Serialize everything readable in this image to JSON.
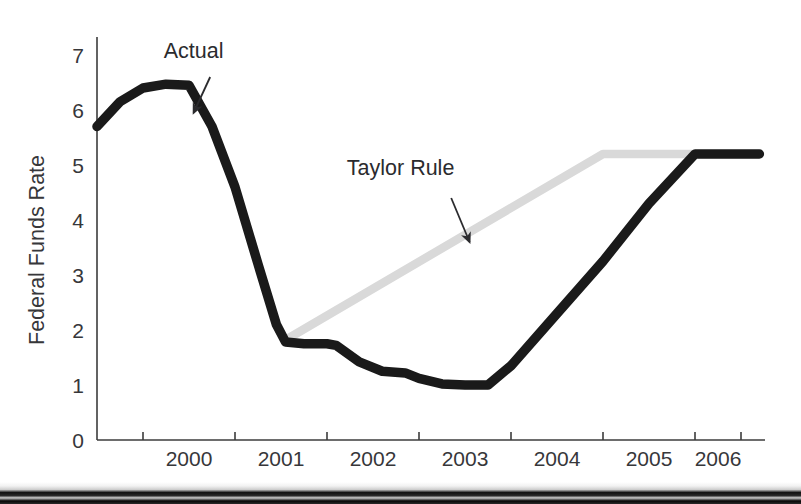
{
  "figure": {
    "background": "#ffffff",
    "scan_band": {
      "name": "scan-artifact-band",
      "top": 482,
      "height": 22,
      "colors": [
        "#f2f2f2",
        "#cfcfcf",
        "#111111",
        "#2a2a2a",
        "#050505"
      ]
    }
  },
  "chart_data": {
    "type": "line",
    "title": "",
    "subtitle": "",
    "xlabel": "",
    "ylabel": "Federal Funds Rate",
    "xlim": [
      1999.5,
      2006.75
    ],
    "ylim": [
      0,
      7.35
    ],
    "grid": false,
    "legend": "none (inline annotations with arrows)",
    "x_ticks": [
      2000.0,
      2001.0,
      2002.0,
      2003.0,
      2004.0,
      2005.0,
      2006.0,
      2006.5
    ],
    "x_tick_labels": [
      "2000",
      "2001",
      "2002",
      "2003",
      "2004",
      "2005",
      "2006"
    ],
    "x_tick_label_positions": [
      2000.5,
      2001.5,
      2002.5,
      2003.5,
      2004.5,
      2005.5,
      2006.25
    ],
    "y_ticks": [
      0,
      1,
      2,
      3,
      4,
      5,
      6,
      7
    ],
    "y_tick_labels": [
      "0",
      "1",
      "2",
      "3",
      "4",
      "5",
      "6",
      "7"
    ],
    "series": [
      {
        "name": "Actual",
        "color": "#1a1a1a",
        "linewidth": 9.5,
        "x": [
          1999.5,
          1999.75,
          2000.0,
          2000.25,
          2000.5,
          2000.75,
          2001.0,
          2001.25,
          2001.45,
          2001.55,
          2001.75,
          2002.0,
          2002.1,
          2002.35,
          2002.6,
          2002.85,
          2003.0,
          2003.25,
          2003.5,
          2003.75,
          2004.0,
          2004.5,
          2005.0,
          2005.5,
          2006.0,
          2006.25,
          2006.7
        ],
        "y": [
          5.7,
          6.15,
          6.4,
          6.47,
          6.45,
          5.7,
          4.6,
          3.2,
          2.1,
          1.78,
          1.75,
          1.75,
          1.72,
          1.42,
          1.25,
          1.22,
          1.12,
          1.02,
          1.0,
          1.0,
          1.35,
          2.3,
          3.25,
          4.3,
          5.2,
          5.2,
          5.2
        ]
      },
      {
        "name": "Taylor Rule",
        "color": "#d9d9d9",
        "linewidth": 8.5,
        "x": [
          2001.58,
          2005.0,
          2006.7
        ],
        "y": [
          1.85,
          5.2,
          5.2
        ]
      }
    ],
    "annotations": [
      {
        "name": "actual-annotation",
        "text": "Actual",
        "text_x": 2000.55,
        "text_y": 6.95,
        "arrow_from_x": 2000.73,
        "arrow_from_y": 6.6,
        "arrow_to_x": 2000.55,
        "arrow_to_y": 5.95,
        "color": "#2b2b2e"
      },
      {
        "name": "taylor-rule-annotation",
        "text": "Taylor Rule",
        "text_x": 2002.8,
        "text_y": 4.82,
        "arrow_from_x": 2003.35,
        "arrow_from_y": 4.4,
        "arrow_to_x": 2003.55,
        "arrow_to_y": 3.6,
        "color": "#2b2b2e"
      }
    ]
  }
}
